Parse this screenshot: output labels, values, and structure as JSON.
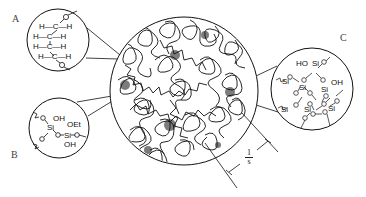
{
  "diagram": {
    "labels": {
      "a": "A",
      "b": "B",
      "c": "C"
    },
    "inset_a": {
      "description": "organic polymer chain",
      "rows": [
        "H—C—H",
        "H—C—H",
        "H—C—H",
        "H—C—H"
      ],
      "end_atom": "O"
    },
    "inset_b": {
      "description": "partially hydrolyzed silica",
      "groups": [
        "OH",
        "OEt",
        "OH"
      ],
      "atoms": [
        "Si",
        "Si",
        "Si",
        "Si"
      ]
    },
    "inset_c": {
      "description": "silica network",
      "groups": [
        "HO",
        "OH"
      ],
      "atoms": [
        "Si",
        "Si",
        "Si",
        "Si",
        "Si",
        "Si",
        "Si"
      ]
    },
    "dimension": {
      "numerator": "1",
      "denominator": "s"
    },
    "colors": {
      "ink": "#111111",
      "background": "#ffffff"
    }
  }
}
